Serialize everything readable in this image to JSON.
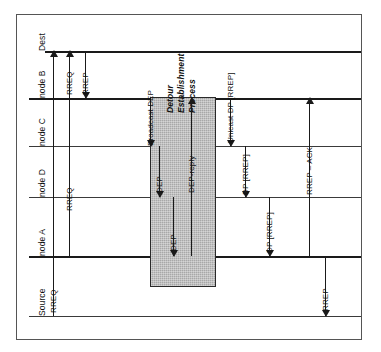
{
  "figure": {
    "orientation": "rotated-90",
    "background_color": "#ffffff",
    "frame_color": "#555555",
    "line_color": "#1a1a1a",
    "shaded_box_color": "#a8a8a8"
  },
  "lifelines": [
    {
      "id": "dest",
      "label": "Dest",
      "y": 50,
      "weight": "heavy"
    },
    {
      "id": "node_b",
      "label": "node B",
      "y": 97,
      "weight": "heavy"
    },
    {
      "id": "node_c",
      "label": "node C",
      "y": 145,
      "weight": "light"
    },
    {
      "id": "node_d",
      "label": "node D",
      "y": 196,
      "weight": "light"
    },
    {
      "id": "node_a",
      "label": "node A",
      "y": 255,
      "weight": "heavy"
    },
    {
      "id": "source",
      "label": "Source",
      "y": 315,
      "weight": "light"
    }
  ],
  "phase_box": {
    "label_lines": [
      "Detour",
      "Establishment",
      "Process"
    ],
    "label_text": "Detour Establishment Process"
  },
  "messages": [
    {
      "id": "m1",
      "label": "RREQ",
      "from": "source",
      "to": "dest",
      "direction": "up"
    },
    {
      "id": "m2",
      "label": "RREQ",
      "from": "node_a",
      "to": "dest",
      "direction": "up"
    },
    {
      "id": "m3",
      "label": "RREP",
      "from": "dest",
      "to": "node_b",
      "direction": "down"
    },
    {
      "id": "m4",
      "label": "Broadcast DEP",
      "from": "node_b",
      "to": "node_c",
      "direction": "down"
    },
    {
      "id": "m5",
      "label": "DEP",
      "from": "node_c",
      "to": "node_d",
      "direction": "down"
    },
    {
      "id": "m6",
      "label": "DEP",
      "from": "node_d",
      "to": "node_a",
      "direction": "down"
    },
    {
      "id": "m7",
      "label": "DEP-reply",
      "from": "node_a",
      "to": "node_b",
      "direction": "up"
    },
    {
      "id": "m8",
      "label": "Unicast DP [RREP]",
      "from": "node_b",
      "to": "node_c",
      "direction": "down"
    },
    {
      "id": "m9",
      "label": "DP [RREP]",
      "from": "node_c",
      "to": "node_d",
      "direction": "down"
    },
    {
      "id": "m10",
      "label": "DP [RREP]",
      "from": "node_d",
      "to": "node_a",
      "direction": "down"
    },
    {
      "id": "m11",
      "label": "RREP – ACK",
      "from": "node_a",
      "to": "node_b",
      "direction": "up"
    },
    {
      "id": "m12",
      "label": "RREP",
      "from": "node_a",
      "to": "source",
      "direction": "down"
    }
  ]
}
